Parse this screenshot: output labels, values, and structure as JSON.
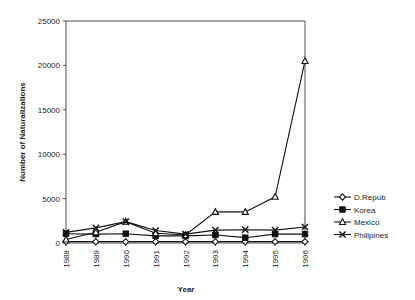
{
  "chart_data": {
    "type": "line",
    "title": "",
    "xlabel": "Year",
    "ylabel": "Number of Naturalizations",
    "categories": [
      "1988",
      "1989",
      "1990",
      "1991",
      "1992",
      "1993",
      "1994",
      "1995",
      "1996"
    ],
    "x": [
      1988,
      1989,
      1990,
      1991,
      1992,
      1993,
      1994,
      1995,
      1996
    ],
    "ylim": [
      0,
      25000
    ],
    "yticks": [
      0,
      5000,
      10000,
      15000,
      20000,
      25000
    ],
    "ytick_labels": [
      "0",
      "5000",
      "10000",
      "15000",
      "20000",
      "25000"
    ],
    "grid": false,
    "legend_position": "right",
    "series": [
      {
        "name": "D.Repub",
        "marker": "open-diamond",
        "values": [
          150,
          150,
          150,
          150,
          150,
          150,
          150,
          150,
          150
        ]
      },
      {
        "name": "Korea",
        "marker": "filled-square",
        "values": [
          1050,
          1000,
          1050,
          800,
          800,
          900,
          600,
          1000,
          1000
        ]
      },
      {
        "name": "Mexico",
        "marker": "open-triangle",
        "values": [
          400,
          1200,
          2400,
          1100,
          900,
          3500,
          3500,
          5200,
          20500
        ]
      },
      {
        "name": "Philipines",
        "marker": "x-cross",
        "values": [
          1200,
          1700,
          2400,
          1400,
          1000,
          1450,
          1500,
          1450,
          1800
        ]
      }
    ]
  },
  "axes": {
    "x_axis_title": "Year",
    "y_axis_title": "Number of Naturalizations"
  },
  "legend": {
    "entries": [
      {
        "label": "D.Repub"
      },
      {
        "label": "Korea"
      },
      {
        "label": "Mexico"
      },
      {
        "label": "Philipines"
      }
    ]
  },
  "colors": {
    "line": "#111111",
    "axis": "#4d4d4d",
    "text": "#1a1a1a",
    "background": "#ffffff"
  }
}
